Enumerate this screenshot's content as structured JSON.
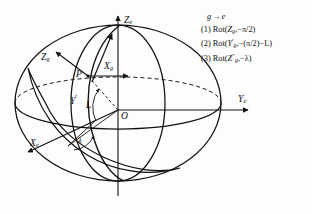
{
  "figure": {
    "kind": "geodetic-frame-rotation-diagram",
    "background": "#fdfdfd",
    "line_color": "#111111"
  },
  "axes": [
    {
      "id": "Ze",
      "base": "Z",
      "sub": "e",
      "desc": "earth-frame vertical axis"
    },
    {
      "id": "Ye",
      "base": "Y",
      "sub": "e",
      "desc": "earth-frame right axis"
    },
    {
      "id": "Xe",
      "base": "X",
      "sub": "e",
      "desc": "earth-frame front-left axis"
    }
  ],
  "frame_axes": [
    {
      "id": "Zg",
      "base": "Z",
      "sub": "g",
      "desc": "geographic-frame up axis at P"
    },
    {
      "id": "Xg",
      "base": "X",
      "sub": "g",
      "desc": "geographic-frame axis at P"
    },
    {
      "id": "Yprime",
      "base": "Y",
      "prime": "′",
      "desc": "intermediate Y axis"
    }
  ],
  "points": {
    "surface_point": "P",
    "origin": "O"
  },
  "angles": {
    "latitude": "L",
    "longitude": "λ"
  },
  "legend": {
    "heading": {
      "from": "g",
      "arrow": "→",
      "to": "e"
    },
    "items": [
      {
        "index": "(1)",
        "rot": "Rot",
        "open": "(",
        "var": "Z",
        "sub": "g",
        "sup": "",
        "comma": ",",
        "angle": "−π/2",
        "close": ")"
      },
      {
        "index": "(2)",
        "rot": "Rot",
        "open": "(",
        "var": "Y",
        "sub": "g",
        "sup": "′",
        "comma": ",",
        "angle": "−(π/2)−L",
        "close": ")"
      },
      {
        "index": "(3)",
        "rot": "Rot",
        "open": "(",
        "var": "Z",
        "sub": "g",
        "sup": "″",
        "comma": ",",
        "angle": "−λ",
        "close": ")"
      }
    ]
  }
}
